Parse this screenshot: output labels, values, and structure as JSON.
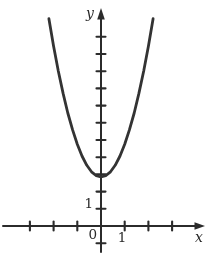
{
  "figure": {
    "ink_color": "#2b2b2b",
    "background_color": "#ffffff"
  },
  "chart_data": {
    "type": "line",
    "title": "",
    "xlabel": "x",
    "ylabel": "y",
    "origin_label": "0",
    "grid": false,
    "legend": false,
    "x_axis": {
      "ticks": [
        -3,
        -2,
        -1,
        1,
        2,
        3
      ],
      "labeled_tick": "1",
      "labeled_tick_value": 1,
      "range": [
        -4.1,
        4.5
      ],
      "unit_px": 23.7
    },
    "y_axis": {
      "ticks": [
        -1,
        1,
        2,
        3,
        4,
        5,
        6,
        7,
        8,
        9,
        10,
        11
      ],
      "labeled_tick": "1",
      "labeled_tick_value": 1,
      "range": [
        -2.2,
        12.7
      ],
      "unit_px": 17.2
    },
    "origin_px": [
      101,
      226
    ],
    "series": [
      {
        "name": "parabola",
        "approx_equation": "y ≈ 2x² + 3",
        "points": [
          [
            -2.2,
            12.05
          ],
          [
            -2.0,
            10.45
          ],
          [
            -1.8,
            9.01
          ],
          [
            -1.6,
            7.71
          ],
          [
            -1.4,
            6.57
          ],
          [
            -1.2,
            5.59
          ],
          [
            -1.0,
            4.75
          ],
          [
            -0.8,
            4.07
          ],
          [
            -0.6,
            3.53
          ],
          [
            -0.4,
            3.15
          ],
          [
            -0.2,
            2.93
          ],
          [
            0,
            2.85
          ],
          [
            0.2,
            2.93
          ],
          [
            0.4,
            3.15
          ],
          [
            0.6,
            3.53
          ],
          [
            0.8,
            4.07
          ],
          [
            1.0,
            4.75
          ],
          [
            1.2,
            5.59
          ],
          [
            1.4,
            6.57
          ],
          [
            1.6,
            7.71
          ],
          [
            1.8,
            9.01
          ],
          [
            2.0,
            10.45
          ],
          [
            2.2,
            12.05
          ]
        ]
      }
    ]
  }
}
